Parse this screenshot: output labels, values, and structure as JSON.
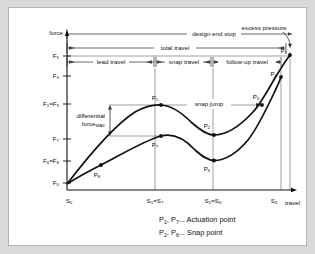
{
  "figure": {
    "axes": {
      "y_axis_label": "force",
      "x_axis_label": "travel",
      "y_ticks": [
        {
          "id": "F5",
          "base": "F",
          "sub": "5",
          "y": 48
        },
        {
          "id": "F4",
          "base": "F",
          "sub": "4",
          "y": 68
        },
        {
          "id": "F1=F3",
          "base": "F",
          "sub": "1",
          "base2": "=F",
          "sub2": "3",
          "y": 96
        },
        {
          "id": "F7",
          "base": "F",
          "sub": "7",
          "y": 131
        },
        {
          "id": "F6=F8",
          "base": "F",
          "sub": "6",
          "base2": "=F",
          "sub2": "8",
          "y": 153
        },
        {
          "id": "F0",
          "base": "F",
          "sub": "0",
          "y": 175
        }
      ],
      "x_ticks": [
        {
          "id": "S0",
          "base": "S",
          "sub": "0",
          "x": 58
        },
        {
          "id": "S1=S7",
          "base": "S",
          "sub": "1",
          "base2": "=S",
          "sub2": "7",
          "x": 146
        },
        {
          "id": "S2=S6",
          "base": "S",
          "sub": "2",
          "base2": "=S",
          "sub2": "6",
          "x": 203
        },
        {
          "id": "S4",
          "base": "S",
          "sub": "4",
          "x": 268
        }
      ]
    },
    "bands": [
      {
        "name": "design-end-stop",
        "label": "design end stop",
        "y": 26,
        "x1": 58,
        "x2": 283
      },
      {
        "name": "total-travel",
        "label": "total travel",
        "y": 40,
        "x1": 58,
        "x2": 277
      },
      {
        "name": "lead-travel",
        "label": "lead travel",
        "y": 54,
        "x1": 58,
        "x2": 145
      },
      {
        "name": "snap-travel",
        "label": "snap travel",
        "y": 54,
        "x1": 147,
        "x2": 202
      },
      {
        "name": "follow-up-travel",
        "label": "follow-up travel",
        "y": 54,
        "x1": 204,
        "x2": 272
      }
    ],
    "annotations": {
      "excess_pressure": "excess pressure",
      "snap_jump": "snap jump",
      "differential_force_line1": "differential",
      "differential_force_base": "force",
      "differential_force_sub": "MAX"
    },
    "points": [
      {
        "id": "P1",
        "base": "P",
        "sub": "1",
        "x": 152,
        "y": 97,
        "lx": 146,
        "ly": 90
      },
      {
        "id": "P2",
        "base": "P",
        "sub": "2",
        "x": 205,
        "y": 127,
        "lx": 199,
        "ly": 118
      },
      {
        "id": "P3",
        "base": "P",
        "sub": "3",
        "x": 253,
        "y": 96,
        "lx": 248,
        "ly": 89
      },
      {
        "id": "P4",
        "base": "P",
        "sub": "4",
        "x": 271,
        "y": 69,
        "lx": 263,
        "ly": 67
      },
      {
        "id": "P5",
        "base": "P",
        "sub": "5",
        "x": 281,
        "y": 48,
        "lx": 277,
        "ly": 45
      },
      {
        "id": "P6",
        "base": "P",
        "sub": "6",
        "x": 205,
        "y": 152,
        "lx": 199,
        "ly": 160
      },
      {
        "id": "P7",
        "base": "P",
        "sub": "7",
        "x": 152,
        "y": 128,
        "lx": 146,
        "ly": 137
      },
      {
        "id": "P8",
        "base": "P",
        "sub": "8",
        "x": 92,
        "y": 157,
        "lx": 88,
        "ly": 166
      }
    ],
    "legend": [
      {
        "p1": "P",
        "s1": "1",
        "p2": "P",
        "s2": "7",
        "text": "... Actuation point"
      },
      {
        "p1": "P",
        "s1": "2",
        "p2": "P",
        "s2": "6",
        "text": "... Snap point"
      }
    ],
    "colors": {
      "panel_bg": "#ffffff",
      "page_bg": "#d9d9d9",
      "curve": "#111111",
      "guide": "#555555",
      "axis": "#111111"
    }
  }
}
